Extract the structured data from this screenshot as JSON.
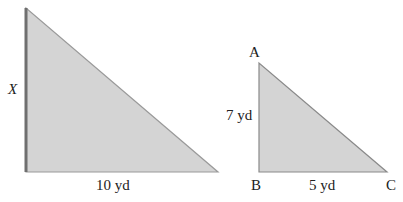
{
  "figure": {
    "large_triangle": {
      "side_label": "X",
      "base_label": "10 yd",
      "fill": "#d4d4d4",
      "edge": "#8a8a8a"
    },
    "small_triangle": {
      "vertex_a": "A",
      "vertex_b": "B",
      "vertex_c": "C",
      "side_label": "7 yd",
      "base_label": "5 yd",
      "fill": "#d4d4d4",
      "edge": "#8a8a8a"
    }
  }
}
